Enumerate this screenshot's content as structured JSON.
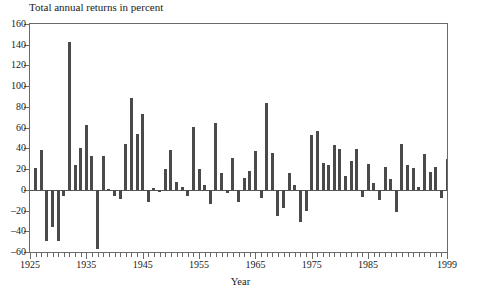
{
  "chart_data": {
    "type": "bar",
    "title": "Total annual returns in percent",
    "xlabel": "Year",
    "ylabel": "",
    "xlim": [
      1925,
      1999
    ],
    "ylim": [
      -60,
      160
    ],
    "ytick_values": [
      -60,
      -40,
      -20,
      0,
      20,
      40,
      60,
      80,
      100,
      120,
      140,
      160
    ],
    "ytick_labels": [
      "–60",
      "–40",
      "–20",
      "0",
      "20",
      "40",
      "60",
      "80",
      "100",
      "120",
      "140",
      "160"
    ],
    "xtick_labels": [
      "1925",
      "1935",
      "1945",
      "1955",
      "1965",
      "1975",
      "1985",
      "1999"
    ],
    "xtick_values": [
      1925,
      1935,
      1945,
      1955,
      1965,
      1975,
      1985,
      1999
    ],
    "xtick_step": 1,
    "grid": false,
    "legend": false,
    "bar_color": "#4a4a4a",
    "axis_color": "#6a6a6a",
    "categories": [
      1926,
      1927,
      1928,
      1929,
      1930,
      1931,
      1932,
      1933,
      1934,
      1935,
      1936,
      1937,
      1938,
      1939,
      1940,
      1941,
      1942,
      1943,
      1944,
      1945,
      1946,
      1947,
      1948,
      1949,
      1950,
      1951,
      1952,
      1953,
      1954,
      1955,
      1956,
      1957,
      1958,
      1959,
      1960,
      1961,
      1962,
      1963,
      1964,
      1965,
      1966,
      1967,
      1968,
      1969,
      1970,
      1971,
      1972,
      1973,
      1974,
      1975,
      1976,
      1977,
      1978,
      1979,
      1980,
      1981,
      1982,
      1983,
      1984,
      1985,
      1986,
      1987,
      1988,
      1989,
      1990,
      1991,
      1992,
      1993,
      1994,
      1995,
      1996,
      1997,
      1998,
      1999
    ],
    "values": [
      21.5,
      38.0,
      -49.0,
      -35.5,
      -49.0,
      -5.5,
      143.0,
      24.0,
      40.0,
      63.0,
      32.5,
      -57.0,
      32.5,
      0.5,
      -5.5,
      -9.0,
      44.5,
      88.5,
      53.5,
      73.5,
      -11.5,
      1.5,
      -2.0,
      20.0,
      38.0,
      7.5,
      3.0,
      -6.0,
      60.5,
      20.0,
      5.0,
      -14.0,
      64.5,
      16.5,
      -3.5,
      30.5,
      -12.0,
      11.5,
      18.5,
      37.5,
      -8.0,
      83.5,
      36.0,
      -25.0,
      -17.5,
      16.5,
      4.5,
      -31.0,
      -20.0,
      52.5,
      57.0,
      25.5,
      23.5,
      43.5,
      39.5,
      13.5,
      28.0,
      39.5,
      -7.0,
      24.5,
      6.5,
      -9.5,
      22.5,
      10.0,
      -21.5,
      44.5,
      23.5,
      21.0,
      3.0,
      34.5,
      17.5,
      22.5,
      -7.5,
      29.5
    ]
  }
}
